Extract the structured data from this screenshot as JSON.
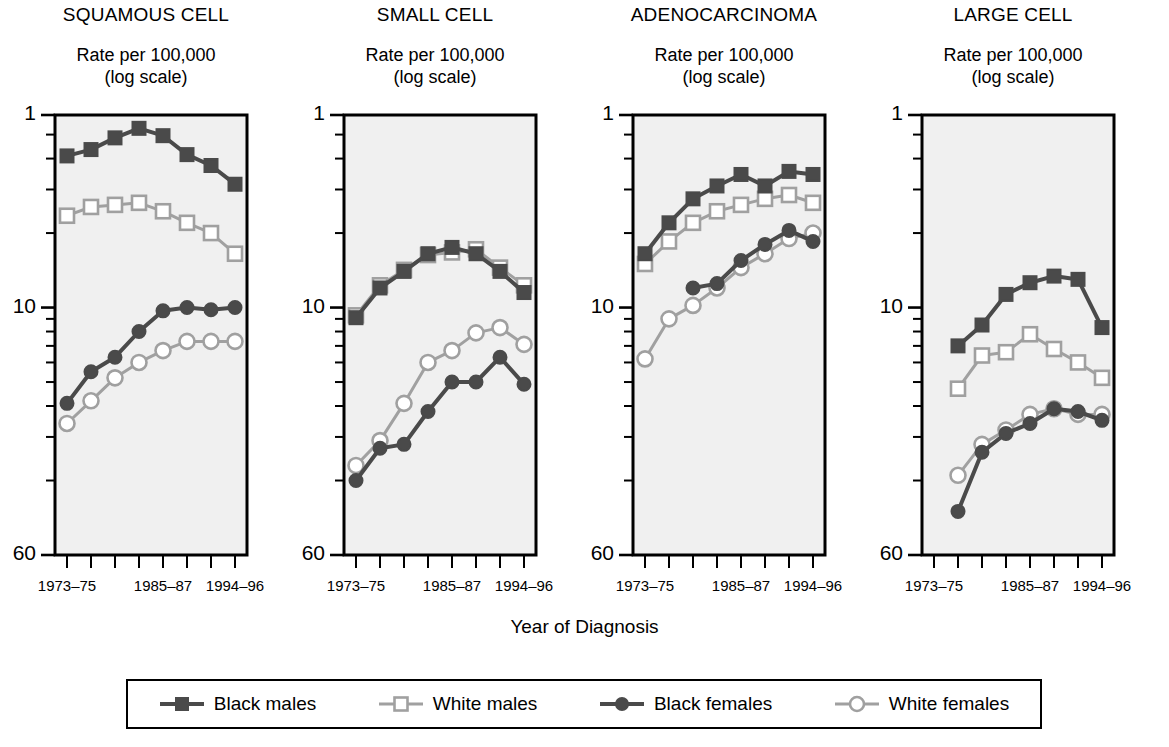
{
  "figure": {
    "xaxis_label": "Year of Diagnosis",
    "y_axis_caption_line1": "Rate per 100,000",
    "y_axis_caption_line2": "(log scale)",
    "y_tick_labels": [
      "60",
      "10",
      "1"
    ],
    "x_tick_labels_shown": [
      "1973–75",
      "1985–87",
      "1994–96"
    ],
    "colors": {
      "dark": "#4a4a4a",
      "light": "#a0a0a0",
      "plot_background": "#f0f0f0",
      "axis": "#000000",
      "marker_fill_open": "#ffffff"
    }
  },
  "legend": {
    "items": [
      {
        "label": "Black males",
        "marker": "filled-square",
        "color": "#4a4a4a"
      },
      {
        "label": "White males",
        "marker": "open-square",
        "color": "#a0a0a0"
      },
      {
        "label": "Black females",
        "marker": "filled-circle",
        "color": "#4a4a4a"
      },
      {
        "label": "White females",
        "marker": "open-circle",
        "color": "#a0a0a0"
      }
    ]
  },
  "chart_data": [
    {
      "type": "line",
      "title": "SQUAMOUS CELL",
      "ylabel": "Rate per 100,000 (log scale)",
      "xlabel": "Year of Diagnosis",
      "yscale": "log",
      "ylim": [
        1,
        60
      ],
      "yticks": [
        1,
        10,
        60
      ],
      "yminorticks": [
        2,
        3,
        4,
        5,
        6,
        7,
        8,
        9,
        20,
        30,
        40,
        50
      ],
      "grid": false,
      "legend_position": "below-figure",
      "categories": [
        "1973–75",
        "1976–78",
        "1979–81",
        "1982–84",
        "1985–87",
        "1988–90",
        "1991–93",
        "1994–96"
      ],
      "series": [
        {
          "name": "Black males",
          "values": [
            41.0,
            43.5,
            48.5,
            53.0,
            49.5,
            41.5,
            37.5,
            31.5
          ]
        },
        {
          "name": "White males",
          "values": [
            23.5,
            25.5,
            26.0,
            26.5,
            24.5,
            22.0,
            20.0,
            16.5
          ]
        },
        {
          "name": "Black females",
          "values": [
            4.1,
            5.5,
            6.3,
            8.0,
            9.7,
            10.0,
            9.8,
            10.0
          ]
        },
        {
          "name": "White females",
          "values": [
            3.4,
            4.2,
            5.2,
            6.0,
            6.7,
            7.3,
            7.3,
            7.3
          ]
        }
      ]
    },
    {
      "type": "line",
      "title": "SMALL CELL",
      "ylabel": "Rate per 100,000 (log scale)",
      "xlabel": "Year of Diagnosis",
      "yscale": "log",
      "ylim": [
        1,
        60
      ],
      "yticks": [
        1,
        10,
        60
      ],
      "yminorticks": [
        2,
        3,
        4,
        5,
        6,
        7,
        8,
        9,
        20,
        30,
        40,
        50
      ],
      "grid": false,
      "legend_position": "below-figure",
      "categories": [
        "1973–75",
        "1976–78",
        "1979–81",
        "1982–84",
        "1985–87",
        "1988–90",
        "1991–93",
        "1994–96"
      ],
      "series": [
        {
          "name": "Black males",
          "values": [
            9.1,
            12.0,
            14.0,
            16.5,
            17.5,
            16.5,
            14.0,
            11.5
          ]
        },
        {
          "name": "White males",
          "values": [
            9.3,
            12.3,
            14.2,
            16.3,
            16.7,
            17.2,
            14.5,
            12.3
          ]
        },
        {
          "name": "Black females",
          "values": [
            2.0,
            2.7,
            2.8,
            3.8,
            5.0,
            5.0,
            6.3,
            4.9
          ]
        },
        {
          "name": "White females",
          "values": [
            2.3,
            2.9,
            4.1,
            6.0,
            6.7,
            7.9,
            8.3,
            7.1
          ]
        }
      ]
    },
    {
      "type": "line",
      "title": "ADENOCARCINOMA",
      "ylabel": "Rate per 100,000 (log scale)",
      "xlabel": "Year of Diagnosis",
      "yscale": "log",
      "ylim": [
        1,
        60
      ],
      "yticks": [
        1,
        10,
        60
      ],
      "yminorticks": [
        2,
        3,
        4,
        5,
        6,
        7,
        8,
        9,
        20,
        30,
        40,
        50
      ],
      "grid": false,
      "legend_position": "below-figure",
      "categories": [
        "1973–75",
        "1976–78",
        "1979–81",
        "1982–84",
        "1985–87",
        "1988–90",
        "1991–93",
        "1994–96"
      ],
      "series": [
        {
          "name": "Black males",
          "values": [
            16.5,
            22.0,
            27.5,
            31.0,
            34.5,
            31.0,
            35.5,
            34.5
          ]
        },
        {
          "name": "White males",
          "values": [
            15.0,
            18.5,
            22.0,
            24.5,
            26.0,
            27.5,
            28.5,
            26.5
          ]
        },
        {
          "name": "Black females",
          "values": [
            null,
            null,
            12.0,
            12.5,
            15.5,
            18.0,
            20.5,
            18.5
          ]
        },
        {
          "name": "White females",
          "values": [
            6.2,
            9.0,
            10.2,
            12.0,
            14.5,
            16.5,
            19.0,
            20.0
          ]
        }
      ]
    },
    {
      "type": "line",
      "title": "LARGE CELL",
      "ylabel": "Rate per 100,000 (log scale)",
      "xlabel": "Year of Diagnosis",
      "yscale": "log",
      "ylim": [
        1,
        60
      ],
      "yticks": [
        1,
        10,
        60
      ],
      "yminorticks": [
        2,
        3,
        4,
        5,
        6,
        7,
        8,
        9,
        20,
        30,
        40,
        50
      ],
      "grid": false,
      "legend_position": "below-figure",
      "categories": [
        "1973–75",
        "1976–78",
        "1979–81",
        "1982–84",
        "1985–87",
        "1988–90",
        "1991–93",
        "1994–96"
      ],
      "series": [
        {
          "name": "Black males",
          "values": [
            null,
            7.0,
            8.5,
            11.3,
            12.6,
            13.4,
            13.0,
            8.3
          ]
        },
        {
          "name": "White males",
          "values": [
            null,
            4.7,
            6.4,
            6.6,
            7.8,
            6.8,
            6.0,
            5.2
          ]
        },
        {
          "name": "Black females",
          "values": [
            null,
            1.5,
            2.6,
            3.1,
            3.4,
            3.9,
            3.8,
            3.5
          ]
        },
        {
          "name": "White females",
          "values": [
            null,
            2.1,
            2.8,
            3.2,
            3.7,
            3.9,
            3.7,
            3.7
          ]
        }
      ]
    }
  ]
}
